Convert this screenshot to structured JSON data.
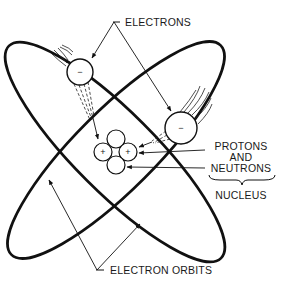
{
  "diagram": {
    "type": "atom-structure",
    "labels": {
      "electrons": "ELECTRONS",
      "protons_line1": "PROTONS",
      "protons_line2": "AND",
      "protons_line3": "NEUTRONS",
      "nucleus": "NUCLEUS",
      "electron_orbits": "ELECTRON ORBITS"
    },
    "electrons": [
      {
        "sign": "−",
        "cx": 80,
        "cy": 72,
        "r": 13
      },
      {
        "sign": "−",
        "cx": 181,
        "cy": 128,
        "r": 16
      }
    ],
    "nucleus_particles": [
      {
        "kind": "neutron",
        "sign": "",
        "cx": 116,
        "cy": 139
      },
      {
        "kind": "proton",
        "sign": "+",
        "cx": 103,
        "cy": 152
      },
      {
        "kind": "proton",
        "sign": "+",
        "cx": 128,
        "cy": 152
      },
      {
        "kind": "neutron",
        "sign": "",
        "cx": 116,
        "cy": 165
      }
    ],
    "colors": {
      "stroke": "#111111",
      "background": "#ffffff"
    }
  }
}
